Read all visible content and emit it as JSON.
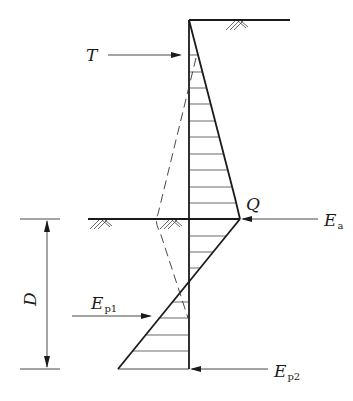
{
  "diagram": {
    "labels": {
      "tie_force": "T",
      "point_q": "Q",
      "active_force_main": "E",
      "active_force_sub": "a",
      "passive1_main": "E",
      "passive1_sub": "p1",
      "passive2_main": "E",
      "passive2_sub": "p2",
      "embedment_depth": "D"
    },
    "geometry": {
      "wall_x": 189,
      "top_ground_y": 20,
      "top_ground_end_x": 290,
      "dredge_line_y": 219,
      "dredge_line_start_x": 88,
      "wall_bottom_y": 369,
      "active_bend_point": [
        235,
        198
      ],
      "active_peak_point": [
        240,
        219
      ],
      "zero_pressure_point": [
        189,
        281
      ],
      "passive_bottom_point": [
        118,
        369
      ],
      "upper_hatch_ys": [
        55,
        72,
        88,
        104,
        121,
        137,
        154,
        170,
        187,
        203
      ],
      "lower_right_hatch_ys": [
        236,
        252,
        268
      ],
      "lower_left_hatch_ys": [
        302,
        318,
        335,
        351
      ]
    },
    "colors": {
      "line": "#1a1a1a",
      "background": "#ffffff"
    }
  }
}
